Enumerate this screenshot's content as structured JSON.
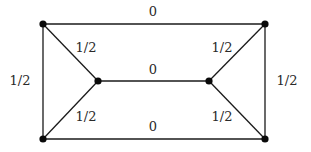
{
  "diagram": {
    "type": "weighted-graph",
    "nodes": [
      {
        "id": "TL",
        "x": 43,
        "y": 24
      },
      {
        "id": "TR",
        "x": 265,
        "y": 24
      },
      {
        "id": "ML",
        "x": 98,
        "y": 81
      },
      {
        "id": "MR",
        "x": 209,
        "y": 81
      },
      {
        "id": "BL",
        "x": 43,
        "y": 139
      },
      {
        "id": "BR",
        "x": 265,
        "y": 139
      }
    ],
    "edges": [
      {
        "from": "TL",
        "to": "TR",
        "label": "0",
        "lx": 153,
        "ly": 16
      },
      {
        "from": "ML",
        "to": "MR",
        "label": "0",
        "lx": 153,
        "ly": 74
      },
      {
        "from": "BL",
        "to": "BR",
        "label": "0",
        "lx": 153,
        "ly": 131
      },
      {
        "from": "TL",
        "to": "BL",
        "label": "1/2",
        "lx": 20,
        "ly": 81
      },
      {
        "from": "TR",
        "to": "BR",
        "label": "1/2",
        "lx": 286,
        "ly": 81
      },
      {
        "from": "TL",
        "to": "ML",
        "label": "1/2",
        "lx": 85,
        "ly": 51
      },
      {
        "from": "BL",
        "to": "ML",
        "label": "1/2",
        "lx": 85,
        "ly": 120
      },
      {
        "from": "TR",
        "to": "MR",
        "label": "1/2",
        "lx": 222,
        "ly": 51
      },
      {
        "from": "BR",
        "to": "MR",
        "label": "1/2",
        "lx": 222,
        "ly": 120
      }
    ]
  },
  "labels": {
    "top": "0",
    "middle": "0",
    "bottom": "0",
    "left": "1/2",
    "right": "1/2",
    "upper_left_diag": "1/2",
    "lower_left_diag": "1/2",
    "upper_right_diag": "1/2",
    "lower_right_diag": "1/2"
  }
}
